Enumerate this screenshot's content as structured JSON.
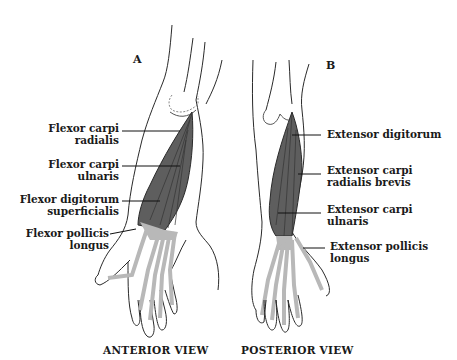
{
  "figure": {
    "colors": {
      "outline": "#2a2a2a",
      "muscle_dark": "#5e5e5e",
      "tendon_light": "#b8b8b8",
      "background": "#ffffff"
    },
    "panels": [
      {
        "letter": "A",
        "view_title": "ANTERIOR VIEW",
        "labels": [
          {
            "line1": "Flexor carpi",
            "line2": "radialis"
          },
          {
            "line1": "Flexor carpi",
            "line2": "ulnaris"
          },
          {
            "line1": "Flexor digitorum",
            "line2": "superficialis"
          },
          {
            "line1": "Flexor pollicis",
            "line2": "longus"
          }
        ]
      },
      {
        "letter": "B",
        "view_title": "POSTERIOR VIEW",
        "labels": [
          {
            "line1": "Extensor digitorum",
            "line2": ""
          },
          {
            "line1": "Extensor carpi",
            "line2": "radialis brevis"
          },
          {
            "line1": "Extensor carpi",
            "line2": "ulnaris"
          },
          {
            "line1": "Extensor pollicis",
            "line2": "longus"
          }
        ]
      }
    ]
  }
}
